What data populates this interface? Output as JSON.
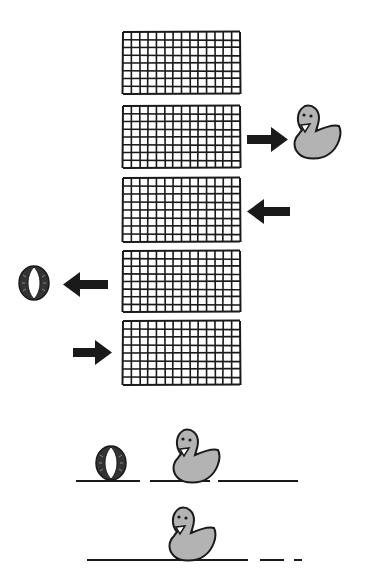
{
  "diagram": {
    "colors": {
      "ink": "#1a1a1a",
      "duck_fill": "#b3b3b3",
      "background": "#ffffff"
    },
    "panels": [
      {
        "id": "grid-1",
        "x": 123,
        "y": 32,
        "w": 117,
        "h": 62,
        "cols": 14,
        "rows": 8
      },
      {
        "id": "grid-2",
        "x": 123,
        "y": 106,
        "w": 117,
        "h": 62,
        "cols": 14,
        "rows": 8
      },
      {
        "id": "grid-3",
        "x": 123,
        "y": 178,
        "w": 117,
        "h": 64,
        "cols": 14,
        "rows": 8
      },
      {
        "id": "grid-4",
        "x": 123,
        "y": 251,
        "w": 117,
        "h": 61,
        "cols": 14,
        "rows": 8
      },
      {
        "id": "grid-5",
        "x": 123,
        "y": 321,
        "w": 117,
        "h": 64,
        "cols": 14,
        "rows": 8
      }
    ],
    "arrows": [
      {
        "id": "arrow-grid2-to-duck",
        "direction": "right"
      },
      {
        "id": "arrow-into-grid3",
        "direction": "left"
      },
      {
        "id": "arrow-grid4-to-wheel",
        "direction": "left"
      },
      {
        "id": "arrow-into-grid5",
        "direction": "right"
      }
    ],
    "icons": [
      "duck-icon",
      "wheel-icon"
    ],
    "timelines": [
      {
        "id": "timeline-1",
        "items": [
          "wheel",
          "duck"
        ]
      },
      {
        "id": "timeline-2",
        "items": [
          "duck"
        ]
      }
    ]
  }
}
